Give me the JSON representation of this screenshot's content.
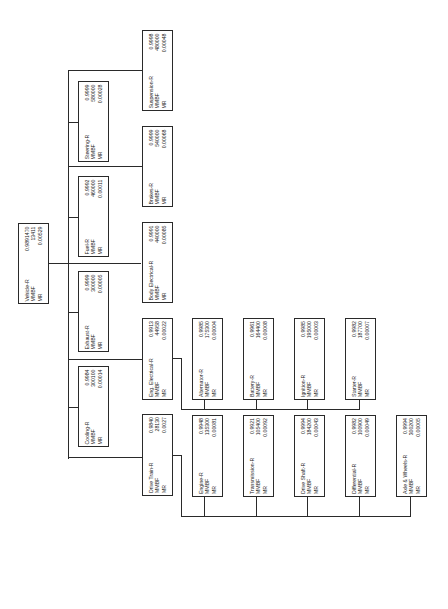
{
  "diagram": {
    "labels": {
      "reliability_suffix": "-R",
      "mmbf": "MMBF",
      "mr": "MR"
    },
    "root": {
      "name": "Vehicle-R",
      "r": "0.9891470",
      "mmbf": "13411",
      "mr": "0.00529"
    },
    "level1": [
      {
        "id": "steering",
        "name": "Steering-R",
        "r": "0.9999",
        "mmbf": "580000",
        "mr": "0.00028"
      },
      {
        "id": "fuel",
        "name": "Fuel-R",
        "r": "0.9992",
        "mmbf": "460000",
        "mr": "0.00011"
      },
      {
        "id": "exhaust",
        "name": "Exhaust-R",
        "r": "0.9999",
        "mmbf": "300000",
        "mr": "0.00005"
      },
      {
        "id": "cooling",
        "name": "Cooling-R",
        "r": "0.9984",
        "mmbf": "300100",
        "mr": "0.00014"
      },
      {
        "id": "suspension",
        "name": "Suspension-R",
        "r": "0.9998",
        "mmbf": "480000",
        "mr": "0.00048"
      },
      {
        "id": "brakes",
        "name": "Brakes-R",
        "r": "0.9999",
        "mmbf": "540000",
        "mr": "0.00068"
      },
      {
        "id": "body-electrical",
        "name": "Body Electrical-R",
        "r": "0.9991",
        "mmbf": "440000",
        "mr": "0.00085"
      },
      {
        "id": "eng-electrical",
        "name": "Eng. Electrical-R",
        "r": "0.9913",
        "mmbf": "44958",
        "mr": "0.00022"
      },
      {
        "id": "drive-train",
        "name": "Drive Train-R",
        "r": "0.9840",
        "mmbf": "28130",
        "mr": "0.0027"
      }
    ],
    "eng_electrical_children": [
      {
        "id": "alternator",
        "name": "Alternator-R",
        "r": "0.9985",
        "mmbf": "175300",
        "mr": "0.00004"
      },
      {
        "id": "battery",
        "name": "Battery-R",
        "r": "0.9961",
        "mmbf": "164400",
        "mr": "0.00008"
      },
      {
        "id": "ignition",
        "name": "Ignition-R",
        "r": "0.9985",
        "mmbf": "195000",
        "mr": "0.00003"
      },
      {
        "id": "starter",
        "name": "Starter-R",
        "r": "0.9982",
        "mmbf": "187700",
        "mr": "0.00007"
      }
    ],
    "drive_train_children": [
      {
        "id": "engine",
        "name": "Engine-R",
        "r": "0.9948",
        "mmbf": "135300",
        "mr": "0.00081"
      },
      {
        "id": "transmission",
        "name": "Transmission-R",
        "r": "0.9921",
        "mmbf": "105400",
        "mr": "0.00092"
      },
      {
        "id": "drive-shaft",
        "name": "Drive Shaft-R",
        "r": "0.9994",
        "mmbf": "184200",
        "mr": "0.00043"
      },
      {
        "id": "differential",
        "name": "Differential-R",
        "r": "0.9982",
        "mmbf": "100900",
        "mr": "0.00049"
      },
      {
        "id": "axle-wheels",
        "name": "Axle & Wheels-R",
        "r": "0.9994",
        "mmbf": "300200",
        "mr": "0.00005"
      }
    ]
  }
}
